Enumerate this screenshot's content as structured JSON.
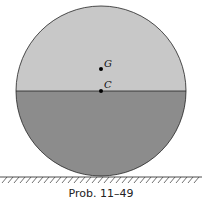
{
  "diagram": {
    "points": [
      {
        "label": "G",
        "x": 101,
        "y": 69
      },
      {
        "label": "C",
        "x": 101,
        "y": 91
      }
    ],
    "colors": {
      "upper_fill": "#c8c8c8",
      "lower_fill": "#8c8c8c",
      "stroke": "#222222"
    },
    "caption": "Prob. 11–49"
  }
}
